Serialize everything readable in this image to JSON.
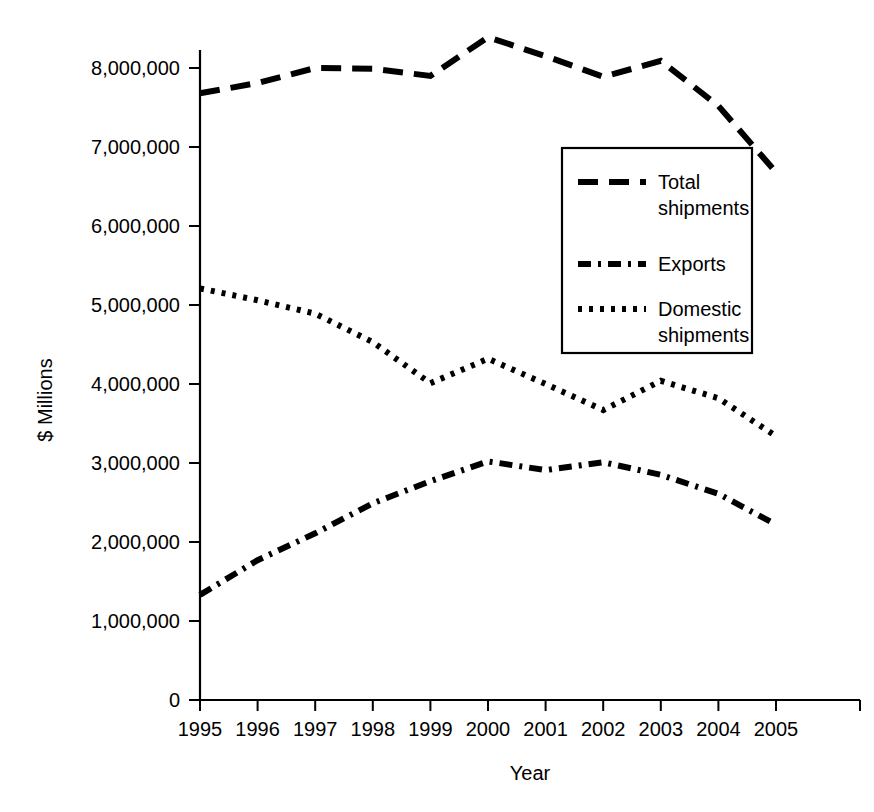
{
  "chart_data": {
    "type": "line",
    "title": "",
    "subtitle": "",
    "xlabel": "Year",
    "ylabel": "$ Millions",
    "x": [
      1995,
      1996,
      1997,
      1998,
      1999,
      2000,
      2001,
      2002,
      2003,
      2004,
      2005
    ],
    "categories": [
      "1995",
      "1996",
      "1997",
      "1998",
      "1999",
      "2000",
      "2001",
      "2002",
      "2003",
      "2004",
      "2005"
    ],
    "xtick_labels": [
      "1995",
      "1996",
      "1997",
      "1998",
      "1999",
      "2000",
      "2001",
      "2002",
      "2003",
      "2004",
      "2005"
    ],
    "ytick_labels": [
      "0",
      "1,000,000",
      "2,000,000",
      "3,000,000",
      "4,000,000",
      "5,000,000",
      "6,000,000",
      "7,000,000",
      "8,000,000"
    ],
    "ytick_values": [
      0,
      1000000,
      2000000,
      3000000,
      4000000,
      5000000,
      6000000,
      7000000,
      8000000
    ],
    "ylim": [
      0,
      8400000
    ],
    "xlim": [
      1995,
      2005
    ],
    "grid": false,
    "legend_position": "center-right-inside",
    "series": [
      {
        "name": "Total shipments",
        "legend_label_line1": "Total",
        "legend_label_line2": "shipments",
        "dash_style": "long-dash",
        "color": "#000000",
        "values": [
          7680000,
          7810000,
          8000000,
          7990000,
          7900000,
          8390000,
          8150000,
          7890000,
          8090000,
          7520000,
          6680000
        ]
      },
      {
        "name": "Exports",
        "legend_label_line1": "Exports",
        "legend_label_line2": "",
        "dash_style": "dash-dot",
        "color": "#000000",
        "values": [
          1330000,
          1770000,
          2110000,
          2490000,
          2770000,
          3020000,
          2910000,
          3010000,
          2850000,
          2610000,
          2220000
        ]
      },
      {
        "name": "Domestic shipments",
        "legend_label_line1": "Domestic",
        "legend_label_line2": "shipments",
        "dash_style": "dotted",
        "color": "#000000",
        "values": [
          5210000,
          5060000,
          4890000,
          4530000,
          4010000,
          4320000,
          4000000,
          3670000,
          4040000,
          3820000,
          3340000
        ]
      }
    ]
  }
}
